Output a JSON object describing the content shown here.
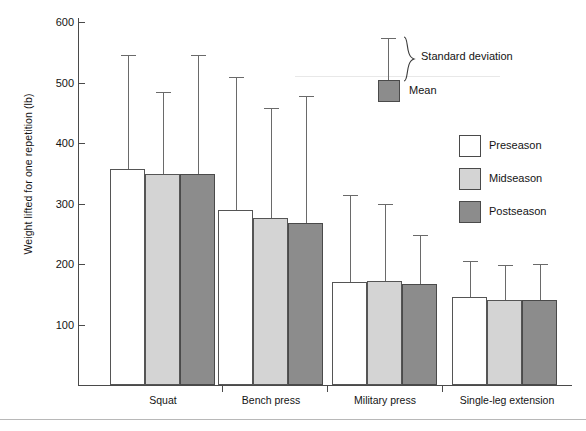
{
  "chart_data": {
    "type": "bar",
    "title": "",
    "xlabel": "",
    "ylabel": "Weight lifted for one repetition (lb)",
    "ylim": [
      0,
      640
    ],
    "yticks": [
      100,
      200,
      300,
      400,
      500,
      600
    ],
    "grid": false,
    "legend_position": "right",
    "error_bars": "standard deviation (upper only)",
    "categories": [
      "Squat",
      "Bench press",
      "Military press",
      "Single-leg extension"
    ],
    "series": [
      {
        "name": "Preseason",
        "color": "#ffffff",
        "values": [
          357,
          290,
          170,
          145
        ],
        "errors_upper": [
          546,
          509,
          314,
          205
        ]
      },
      {
        "name": "Midseason",
        "color": "#d4d4d4",
        "values": [
          349,
          276,
          172,
          141
        ],
        "errors_upper": [
          484,
          458,
          300,
          198
        ]
      },
      {
        "name": "Postseason",
        "color": "#8c8c8c",
        "values": [
          349,
          268,
          167,
          141
        ],
        "errors_upper": [
          546,
          478,
          248,
          200
        ]
      }
    ]
  },
  "axes": {
    "y_label": "Weight lifted for one repetition (lb)",
    "y_tick_labels": [
      "600",
      "500",
      "400",
      "300",
      "200",
      "100"
    ],
    "x_tick_labels": [
      "Squat",
      "Bench press",
      "Military press",
      "Single-leg extension"
    ]
  },
  "key": {
    "sd_label": "Standard deviation",
    "mean_label": "Mean",
    "mean_color": "#8c8c8c"
  },
  "legend": {
    "items": [
      {
        "label": "Preseason",
        "color": "#ffffff"
      },
      {
        "label": "Midseason",
        "color": "#d4d4d4"
      },
      {
        "label": "Postseason",
        "color": "#8c8c8c"
      }
    ]
  },
  "footer": {
    "caption": ""
  }
}
